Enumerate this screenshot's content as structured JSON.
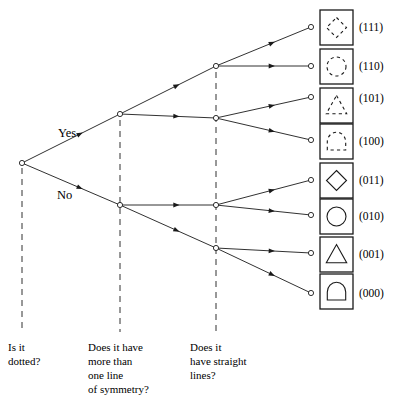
{
  "diagram": {
    "type": "decision-tree",
    "root": {
      "x": 22,
      "y": 163,
      "label": "root-node"
    },
    "branch_labels": [
      {
        "text": "Yes",
        "x": 58,
        "y": 127
      },
      {
        "text": "No",
        "x": 57,
        "y": 189
      }
    ],
    "questions": [
      {
        "id": "q1",
        "text": "Is it\ndotted?",
        "x": 8,
        "y": 340,
        "guide_x": 22,
        "guide_top": 168,
        "guide_bottom": 332
      },
      {
        "id": "q2",
        "text": "Does it have\nmore than\none line\nof symmetry?",
        "x": 88,
        "y": 340,
        "guide_x": 120,
        "guide_top": 120,
        "guide_bottom": 332
      },
      {
        "id": "q3",
        "text": "Does it\nhave straight\nlines?",
        "x": 190,
        "y": 340,
        "guide_x": 216,
        "guide_top": 72,
        "guide_bottom": 332
      }
    ],
    "level2_nodes": [
      {
        "id": "yes-node",
        "x": 120,
        "y": 114
      },
      {
        "id": "no-node",
        "x": 120,
        "y": 205
      }
    ],
    "level3_nodes": [
      {
        "id": "n-yy",
        "x": 216,
        "y": 66
      },
      {
        "id": "n-yn",
        "x": 216,
        "y": 118
      },
      {
        "id": "n-ny",
        "x": 216,
        "y": 205
      },
      {
        "id": "n-nn",
        "x": 216,
        "y": 248
      }
    ],
    "edges": [
      {
        "from": "root",
        "to": "yes-node",
        "x1": 22,
        "y1": 163,
        "x2": 120,
        "y2": 114
      },
      {
        "from": "root",
        "to": "no-node",
        "x1": 22,
        "y1": 163,
        "x2": 120,
        "y2": 205
      },
      {
        "from": "yes-node",
        "to": "n-yy",
        "x1": 120,
        "y1": 114,
        "x2": 216,
        "y2": 66
      },
      {
        "from": "yes-node",
        "to": "n-yn",
        "x1": 120,
        "y1": 114,
        "x2": 216,
        "y2": 118
      },
      {
        "from": "no-node",
        "to": "n-ny",
        "x1": 120,
        "y1": 205,
        "x2": 216,
        "y2": 205
      },
      {
        "from": "no-node",
        "to": "n-nn",
        "x1": 120,
        "y1": 205,
        "x2": 216,
        "y2": 248
      },
      {
        "from": "n-yy",
        "to": "leaf-111",
        "x1": 216,
        "y1": 66,
        "x2": 311,
        "y2": 27
      },
      {
        "from": "n-yy",
        "to": "leaf-110",
        "x1": 216,
        "y1": 66,
        "x2": 311,
        "y2": 66
      },
      {
        "from": "n-yn",
        "to": "leaf-101",
        "x1": 216,
        "y1": 118,
        "x2": 311,
        "y2": 97
      },
      {
        "from": "n-yn",
        "to": "leaf-100",
        "x1": 216,
        "y1": 118,
        "x2": 311,
        "y2": 140
      },
      {
        "from": "n-ny",
        "to": "leaf-011",
        "x1": 216,
        "y1": 205,
        "x2": 311,
        "y2": 180
      },
      {
        "from": "n-ny",
        "to": "leaf-010",
        "x1": 216,
        "y1": 205,
        "x2": 311,
        "y2": 215
      },
      {
        "from": "n-nn",
        "to": "leaf-001",
        "x1": 216,
        "y1": 248,
        "x2": 311,
        "y2": 253
      },
      {
        "from": "n-nn",
        "to": "leaf-000",
        "x1": 216,
        "y1": 248,
        "x2": 311,
        "y2": 293
      }
    ],
    "leaves": [
      {
        "code": "(111)",
        "shape": "diamond",
        "dotted": true,
        "leaf_x": 311,
        "leaf_y": 27,
        "box_x": 320,
        "box_y": 10,
        "label_x": 359,
        "label_y": 22
      },
      {
        "code": "(110)",
        "shape": "circle",
        "dotted": true,
        "leaf_x": 311,
        "leaf_y": 66,
        "box_x": 320,
        "box_y": 49,
        "label_x": 359,
        "label_y": 61
      },
      {
        "code": "(101)",
        "shape": "triangle",
        "dotted": true,
        "leaf_x": 311,
        "leaf_y": 97,
        "box_x": 320,
        "box_y": 88,
        "label_x": 359,
        "label_y": 93
      },
      {
        "code": "(100)",
        "shape": "dome",
        "dotted": true,
        "leaf_x": 311,
        "leaf_y": 140,
        "box_x": 320,
        "box_y": 124,
        "label_x": 359,
        "label_y": 136
      },
      {
        "code": "(011)",
        "shape": "diamond",
        "dotted": false,
        "leaf_x": 311,
        "leaf_y": 180,
        "box_x": 320,
        "box_y": 163,
        "label_x": 359,
        "label_y": 175
      },
      {
        "code": "(010)",
        "shape": "circle",
        "dotted": false,
        "leaf_x": 311,
        "leaf_y": 215,
        "box_x": 320,
        "box_y": 199,
        "label_x": 359,
        "label_y": 211
      },
      {
        "code": "(001)",
        "shape": "triangle",
        "dotted": false,
        "leaf_x": 311,
        "leaf_y": 253,
        "box_x": 320,
        "box_y": 237,
        "label_x": 359,
        "label_y": 249
      },
      {
        "code": "(000)",
        "shape": "dome",
        "dotted": false,
        "leaf_x": 311,
        "leaf_y": 293,
        "box_x": 320,
        "box_y": 274,
        "label_x": 359,
        "label_y": 288
      }
    ],
    "box_size": {
      "w": 33,
      "h": 35
    },
    "colors": {
      "stroke": "#1a1a1a",
      "background": "#ffffff"
    }
  }
}
